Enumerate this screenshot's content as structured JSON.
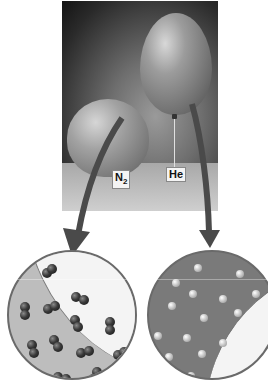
{
  "figure": {
    "labels": {
      "n2_main": "N",
      "n2_sub": "2",
      "he": "He"
    },
    "views": [
      {
        "gas": "N2",
        "particle_type": "diatomic",
        "particle_color": "#2e2e2e",
        "background": "#bdbdbd",
        "particle_count": 14
      },
      {
        "gas": "He",
        "particle_type": "monatomic",
        "particle_color": "#d0d0d0",
        "background": "#7a7a7a",
        "particle_count": 17
      }
    ],
    "colors": {
      "arrow": "#4a4a4a",
      "circle_border": "#6a6a6a",
      "photo_dark": "#141414"
    }
  }
}
